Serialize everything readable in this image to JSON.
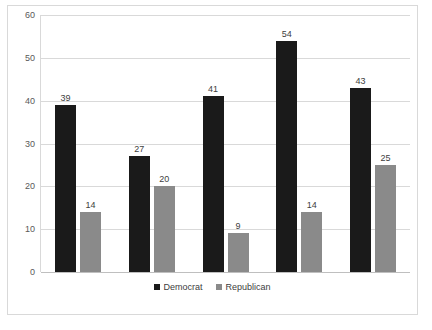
{
  "chart_data": {
    "type": "bar",
    "title": "",
    "subtitle": "",
    "xlabel": "",
    "ylabel": "",
    "ylim": [
      0,
      60
    ],
    "yticks": [
      0,
      10,
      20,
      30,
      40,
      50,
      60
    ],
    "grid": true,
    "legend_position": "bottom",
    "categories": [
      "1",
      "2",
      "3",
      "4",
      "5"
    ],
    "series": [
      {
        "name": "Democrat",
        "color": "#1a1a1a",
        "values": [
          39,
          27,
          41,
          54,
          43
        ]
      },
      {
        "name": "Republican",
        "color": "#8a8a8a",
        "values": [
          14,
          20,
          9,
          14,
          25
        ]
      }
    ]
  },
  "legend": {
    "items": [
      {
        "label": "Democrat"
      },
      {
        "label": "Republican"
      }
    ]
  },
  "caption": {
    "text": ""
  },
  "colors": {
    "democrat": "#1a1a1a",
    "republican": "#8a8a8a",
    "gridline": "#d9d9d9",
    "frame": "#d9d9d9",
    "tick_text": "#595959"
  }
}
